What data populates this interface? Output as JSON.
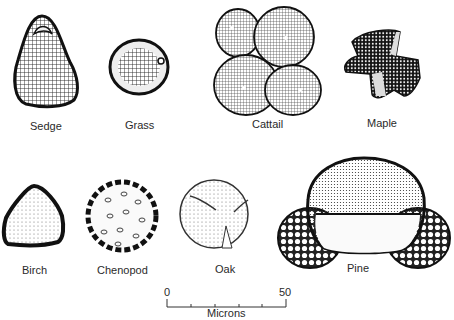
{
  "figure": {
    "specimens": [
      {
        "name": "Sedge",
        "label_x": 30,
        "label_y": 120
      },
      {
        "name": "Grass",
        "label_x": 125,
        "label_y": 119
      },
      {
        "name": "Cattail",
        "label_x": 252,
        "label_y": 118
      },
      {
        "name": "Maple",
        "label_x": 367,
        "label_y": 117
      },
      {
        "name": "Birch",
        "label_x": 22,
        "label_y": 264
      },
      {
        "name": "Chenopod",
        "label_x": 97,
        "label_y": 264
      },
      {
        "name": "Oak",
        "label_x": 215,
        "label_y": 263
      },
      {
        "name": "Pine",
        "label_x": 347,
        "label_y": 262
      }
    ],
    "scale_bar": {
      "start_label": "0",
      "end_label": "50",
      "unit_label": "Microns",
      "min": 0,
      "max": 50,
      "tick_count": 6
    }
  }
}
